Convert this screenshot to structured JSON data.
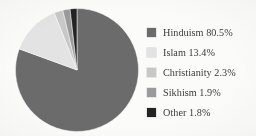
{
  "figure": {
    "background_color": "#fbfbfa",
    "text_color": "#2e2d2b"
  },
  "chart_data": {
    "type": "pie",
    "title": "",
    "subtitle": "",
    "xlabel": "",
    "ylabel": "",
    "grid": false,
    "legend_position": "right",
    "start_angle_deg": 0,
    "direction": "clockwise",
    "units": "percent",
    "categories": [
      "Hinduism",
      "Islam",
      "Christianity",
      "Sikhism",
      "Other"
    ],
    "values": [
      80.5,
      13.4,
      2.3,
      1.9,
      1.8
    ],
    "colors": [
      "#6b6b6b",
      "#e3e3e3",
      "#c8c8c8",
      "#9a9a9a",
      "#232323"
    ],
    "slices": [
      {
        "label": "Hinduism",
        "value": 80.5,
        "value_text": "80.5%",
        "color": "#6b6b6b",
        "legend_text": "Hinduism 80.5%"
      },
      {
        "label": "Islam",
        "value": 13.4,
        "value_text": "13.4%",
        "color": "#e3e3e3",
        "legend_text": "Islam 13.4%"
      },
      {
        "label": "Christianity",
        "value": 2.3,
        "value_text": "2.3%",
        "color": "#c8c8c8",
        "legend_text": "Christianity 2.3%"
      },
      {
        "label": "Sikhism",
        "value": 1.9,
        "value_text": "1.9%",
        "color": "#9a9a9a",
        "legend_text": "Sikhism 1.9%"
      },
      {
        "label": "Other",
        "value": 1.8,
        "value_text": "1.8%",
        "color": "#232323",
        "legend_text": "Other 1.8%"
      }
    ]
  },
  "legend": {
    "items": [
      {
        "label": "Hinduism 80.5%",
        "color": "#6b6b6b"
      },
      {
        "label": "Islam 13.4%",
        "color": "#e3e3e3"
      },
      {
        "label": "Christianity 2.3%",
        "color": "#c8c8c8"
      },
      {
        "label": "Sikhism 1.9%",
        "color": "#9a9a9a"
      },
      {
        "label": "Other 1.8%",
        "color": "#232323"
      }
    ]
  }
}
